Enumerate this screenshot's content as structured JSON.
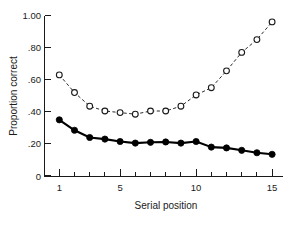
{
  "chart_data": {
    "type": "line",
    "title": "",
    "xlabel": "Serial position",
    "ylabel": "Proportion correct",
    "xlim": [
      0.4,
      15.6
    ],
    "ylim": [
      0,
      1.0
    ],
    "grid": false,
    "legend": "none",
    "x": [
      1,
      2,
      3,
      4,
      5,
      6,
      7,
      8,
      9,
      10,
      11,
      12,
      13,
      14,
      15
    ],
    "x_tick_values": [
      1,
      5,
      10,
      15
    ],
    "x_tick_labels": [
      "1",
      "5",
      "10",
      "15"
    ],
    "x_minor_ticks": [
      2,
      3,
      4,
      6,
      7,
      8,
      9,
      11,
      12,
      13,
      14
    ],
    "y_tick_values": [
      0,
      0.2,
      0.4,
      0.6,
      0.8,
      1.0
    ],
    "y_tick_labels": [
      "0",
      ".20",
      ".40",
      ".60",
      ".80",
      "1.00"
    ],
    "series": [
      {
        "name": "open-circle-series",
        "marker": "open-circle",
        "linestyle": "dashed",
        "color": "#1a1a1a",
        "values": [
          0.63,
          0.52,
          0.435,
          0.405,
          0.395,
          0.385,
          0.405,
          0.405,
          0.435,
          0.505,
          0.55,
          0.655,
          0.77,
          0.85,
          0.96
        ]
      },
      {
        "name": "filled-circle-series",
        "marker": "filled-circle",
        "linestyle": "solid",
        "color": "#000000",
        "values": [
          0.35,
          0.285,
          0.24,
          0.23,
          0.215,
          0.205,
          0.21,
          0.212,
          0.205,
          0.215,
          0.18,
          0.175,
          0.16,
          0.145,
          0.135
        ]
      }
    ]
  },
  "axes": {
    "y_title": "Proportion correct",
    "x_title": "Serial position"
  }
}
